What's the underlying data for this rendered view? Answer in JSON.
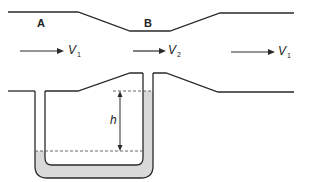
{
  "diagram": {
    "type": "venturi-meter-with-u-tube-manometer",
    "labels": {
      "section_a": "A",
      "section_b": "B",
      "height": "h"
    },
    "velocities": [
      {
        "name": "V",
        "sub": "1",
        "position": "inlet"
      },
      {
        "name": "V",
        "sub": "2",
        "position": "throat"
      },
      {
        "name": "V",
        "sub": "1",
        "position": "outlet"
      }
    ],
    "colors": {
      "line": "#2a2a2a",
      "fluid": "#d9d9d9",
      "dashed": "#555555"
    }
  }
}
